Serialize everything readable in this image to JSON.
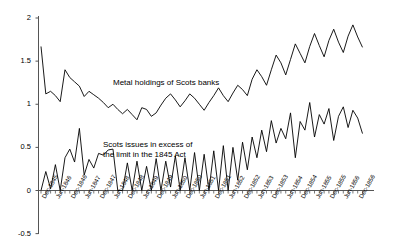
{
  "chart_data": {
    "type": "line",
    "title": "",
    "subtitle": "",
    "xlabel": "",
    "ylabel": "",
    "ylim": [
      -0.5,
      2
    ],
    "xlim": [
      0,
      68
    ],
    "grid": false,
    "legend_position": "inline-annotation",
    "y_ticks": [
      "2",
      "1.5",
      "1",
      "0.5",
      "0",
      "-0.5"
    ],
    "y_tick_values": [
      2,
      1.5,
      1,
      0.5,
      0,
      -0.5
    ],
    "x_tick_labels": [
      "Dec-1845",
      "Jun-1846",
      "Dec-1846",
      "Jun-1847",
      "Dec-1847",
      "Jun-1848",
      "Dec-1848",
      "Jun-1849",
      "Dec-1849",
      "Jun-1850",
      "Dec-1850",
      "Jun-1851",
      "Dec-1851",
      "Jun-1852",
      "Dec-1852",
      "Jun-1853",
      "Dec-1853",
      "Jun-1854",
      "Dec-1854",
      "Jun-1855",
      "Dec-1855",
      "Jun-1856",
      "Dec-1856"
    ],
    "x_tick_interval_points": 3,
    "annotations": [
      {
        "name": "metal-holdings-annotation",
        "text": "Metal holdings of Scots banks",
        "x_px": 113,
        "y_px": 78
      },
      {
        "name": "scots-issues-annotation-line1",
        "text": "Scots issues in excess of",
        "x_px": 103,
        "y_px": 140
      },
      {
        "name": "scots-issues-annotation-line2",
        "text": "the limit in the 1845 Act",
        "x_px": 103,
        "y_px": 150
      }
    ],
    "series": [
      {
        "name": "Metal holdings of Scots banks",
        "color": "#000000",
        "values": [
          1.67,
          1.12,
          1.15,
          1.1,
          1.03,
          1.4,
          1.31,
          1.26,
          1.21,
          1.09,
          1.15,
          1.11,
          1.07,
          1.02,
          0.96,
          1.0,
          0.94,
          0.89,
          0.94,
          0.88,
          0.82,
          0.96,
          0.94,
          0.86,
          0.9,
          0.99,
          1.07,
          1.12,
          1.05,
          0.97,
          1.04,
          1.12,
          1.07,
          1.0,
          0.93,
          1.02,
          1.1,
          1.19,
          1.1,
          1.03,
          1.13,
          1.22,
          1.17,
          1.1,
          1.29,
          1.4,
          1.32,
          1.22,
          1.4,
          1.57,
          1.48,
          1.34,
          1.52,
          1.7,
          1.59,
          1.48,
          1.67,
          1.82,
          1.68,
          1.55,
          1.74,
          1.87,
          1.72,
          1.6,
          1.79,
          1.92,
          1.78,
          1.66
        ]
      },
      {
        "name": "Scots issues in excess of the limit in the 1845 Act",
        "color": "#000000",
        "values": [
          0.0,
          0.22,
          0.02,
          0.3,
          0.0,
          0.38,
          0.48,
          0.33,
          0.72,
          0.18,
          0.36,
          0.26,
          0.43,
          0.41,
          0.47,
          0.48,
          0.0,
          0.0,
          0.32,
          0.0,
          0.34,
          0.0,
          0.28,
          0.0,
          0.37,
          0.0,
          0.34,
          0.04,
          0.4,
          0.0,
          0.38,
          0.0,
          0.44,
          0.0,
          0.42,
          0.0,
          0.46,
          0.0,
          0.52,
          0.0,
          0.5,
          0.12,
          0.56,
          0.24,
          0.62,
          0.38,
          0.7,
          0.45,
          0.81,
          0.55,
          0.72,
          0.6,
          0.9,
          0.38,
          0.8,
          0.7,
          1.02,
          0.62,
          0.88,
          0.77,
          0.95,
          0.58,
          0.86,
          0.97,
          0.73,
          0.93,
          0.84,
          0.66
        ]
      }
    ]
  },
  "axes": {
    "y_axis_name": "y-axis",
    "x_axis_name": "x-axis"
  }
}
